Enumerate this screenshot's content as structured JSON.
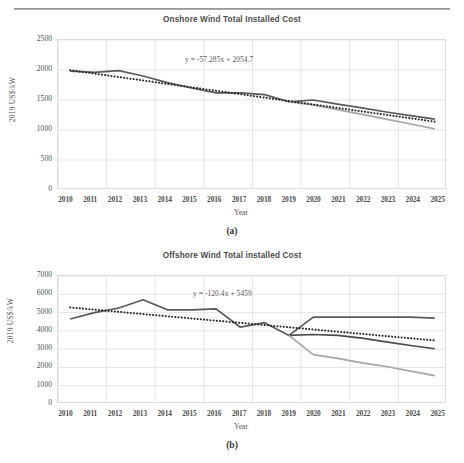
{
  "page": {
    "header_left": "",
    "header_right": ""
  },
  "figures": [
    {
      "id": "a",
      "caption": "(a)",
      "title": "Onshore Wind Total Installed Cost",
      "equation": "y = -57.285x + 2054.7",
      "xlabel": "Year",
      "ylabel": "2019 US$/kW",
      "yticks": [
        "2500",
        "2000",
        "1500",
        "1000",
        "500",
        "0"
      ],
      "xticks": [
        "2010",
        "2011",
        "2012",
        "2013",
        "2014",
        "2015",
        "2016",
        "2017",
        "2018",
        "2019",
        "2020",
        "2021",
        "2022",
        "2023",
        "2024",
        "2025"
      ]
    },
    {
      "id": "b",
      "caption": "(b)",
      "title": "Offshore Wind Total installed Cost",
      "equation": "y = -120.4x + 5459",
      "xlabel": "Year",
      "ylabel": "2019 US$/kW",
      "yticks": [
        "7000",
        "6000",
        "5000",
        "4000",
        "3000",
        "2000",
        "1000",
        "0"
      ],
      "xticks": [
        "2010",
        "2011",
        "2012",
        "2013",
        "2014",
        "2015",
        "2016",
        "2017",
        "2018",
        "2019",
        "2020",
        "2021",
        "2022",
        "2023",
        "2024",
        "2025"
      ]
    }
  ],
  "colors": {
    "historic_line": "#595959",
    "projection_high": "#4a4a4a",
    "projection_low": "#a6a6a6",
    "trend_dotted": "#262626",
    "grid": "#e2e2e2",
    "plot_border": "#dcdcdc"
  },
  "chart_data": [
    {
      "type": "line",
      "id": "a",
      "title": "Onshore Wind Total Installed Cost",
      "xlabel": "Year",
      "ylabel": "2019 US$/kW",
      "ylim": [
        0,
        2500
      ],
      "ytick_step": 500,
      "grid": true,
      "legend": "none",
      "annotations": [
        "y = -57.285x + 2054.7"
      ],
      "x": [
        2010,
        2011,
        2012,
        2013,
        2014,
        2015,
        2016,
        2017,
        2018,
        2019,
        2020,
        2021,
        2022,
        2023,
        2024,
        2025
      ],
      "series": [
        {
          "name": "Historic / high projection",
          "style": "solid-dark",
          "values": [
            1980,
            1960,
            1990,
            1900,
            1790,
            1700,
            1620,
            1620,
            1590,
            1470,
            1500,
            1430,
            1370,
            1300,
            1240,
            1180
          ]
        },
        {
          "name": "Low projection",
          "style": "solid-light",
          "values": [
            null,
            null,
            null,
            null,
            null,
            null,
            null,
            null,
            null,
            1470,
            1420,
            1340,
            1260,
            1180,
            1100,
            1020
          ]
        },
        {
          "name": "Linear trend",
          "style": "dotted",
          "values": [
            1997,
            1940,
            1883,
            1826,
            1768,
            1711,
            1654,
            1597,
            1539,
            1482,
            1425,
            1368,
            1310,
            1253,
            1196,
            1139
          ]
        }
      ]
    },
    {
      "type": "line",
      "id": "b",
      "title": "Offshore Wind Total installed Cost",
      "xlabel": "Year",
      "ylabel": "2019 US$/kW",
      "ylim": [
        0,
        7000
      ],
      "ytick_step": 1000,
      "grid": true,
      "legend": "none",
      "annotations": [
        "y = -120.4x + 5459"
      ],
      "x": [
        2010,
        2011,
        2012,
        2013,
        2014,
        2015,
        2016,
        2017,
        2018,
        2019,
        2020,
        2021,
        2022,
        2023,
        2024,
        2025
      ],
      "series": [
        {
          "name": "Historic / flat projection",
          "style": "solid-dark",
          "values": [
            4650,
            5000,
            5250,
            5700,
            5150,
            5150,
            5200,
            4200,
            4450,
            3750,
            4750,
            4750,
            4750,
            4750,
            4750,
            4700
          ]
        },
        {
          "name": "Declining projection",
          "style": "solid-dark2",
          "values": [
            null,
            null,
            null,
            null,
            null,
            null,
            null,
            null,
            null,
            3750,
            3800,
            3750,
            3600,
            3400,
            3200,
            3020
          ]
        },
        {
          "name": "Low projection",
          "style": "solid-light",
          "values": [
            null,
            null,
            null,
            null,
            null,
            null,
            null,
            null,
            null,
            3750,
            2700,
            2500,
            2250,
            2050,
            1800,
            1550
          ]
        },
        {
          "name": "Linear trend",
          "style": "dotted",
          "values": [
            5280,
            5159,
            5039,
            4918,
            4798,
            4678,
            4557,
            4437,
            4316,
            4196,
            4076,
            3955,
            3835,
            3714,
            3594,
            3474
          ]
        }
      ]
    }
  ]
}
